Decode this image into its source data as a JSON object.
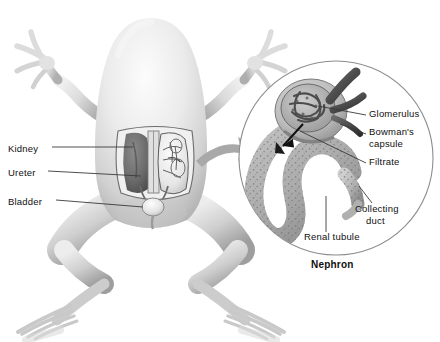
{
  "figure": {
    "caption": "Nephron",
    "organism": "frog",
    "view": "dorsal"
  },
  "body_labels": [
    {
      "id": "kidney",
      "text": "Kidney",
      "x": 8,
      "y": 143
    },
    {
      "id": "ureter",
      "text": "Ureter",
      "x": 8,
      "y": 167
    },
    {
      "id": "bladder",
      "text": "Bladder",
      "x": 8,
      "y": 196
    }
  ],
  "nephron_labels": [
    {
      "id": "glomerulus",
      "text": "Glomerulus",
      "x": 369,
      "y": 113
    },
    {
      "id": "bowmans-capsule",
      "text": "Bowman's",
      "x": 369,
      "y": 131
    },
    {
      "id": "bowmans-capsule-2",
      "text": "capsule",
      "x": 369,
      "y": 143
    },
    {
      "id": "filtrate",
      "text": "Filtrate",
      "x": 369,
      "y": 161
    },
    {
      "id": "collecting-duct",
      "text": "Collecting",
      "x": 355,
      "y": 208
    },
    {
      "id": "collecting-duct-2",
      "text": "duct",
      "x": 363,
      "y": 220
    },
    {
      "id": "renal-tubule",
      "text": "Renal tubule",
      "x": 304,
      "y": 236
    }
  ],
  "colors": {
    "line": "#3a3a3a",
    "text": "#101010",
    "circle_outline": "#8d8d8d",
    "arrow_fill": "#a9a9a9",
    "kidney_dark": "#6f6f6f",
    "tubule": "#b4b4b4",
    "background": "#ffffff"
  }
}
